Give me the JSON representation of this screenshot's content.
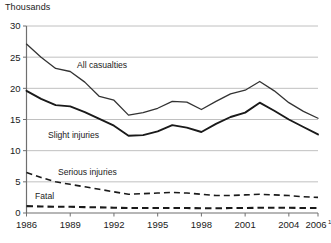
{
  "chart_data": {
    "type": "line",
    "title": "Thousands",
    "xlabel": "",
    "ylabel": "Thousands",
    "ylim": [
      0,
      30
    ],
    "yticks": [
      0,
      5,
      10,
      15,
      20,
      25,
      30
    ],
    "xlim": [
      1986,
      2006
    ],
    "xticks": [
      1986,
      1989,
      1992,
      1995,
      1998,
      2001,
      2004,
      2006
    ],
    "xtick_labels": [
      "1986",
      "1989",
      "1992",
      "1995",
      "1998",
      "2001",
      "2004",
      "2006"
    ],
    "last_xtick_superscript": "1",
    "grid": "horizontal",
    "legend_position": "inline-labels",
    "x": [
      1986,
      1987,
      1988,
      1989,
      1990,
      1991,
      1992,
      1993,
      1994,
      1995,
      1996,
      1997,
      1998,
      1999,
      2000,
      2001,
      2002,
      2003,
      2004,
      2005,
      2006
    ],
    "series": [
      {
        "name": "All casualties",
        "style": "solid-thin",
        "values": [
          27.1,
          25.0,
          23.2,
          22.7,
          21.0,
          18.7,
          18.1,
          15.7,
          16.1,
          16.8,
          17.9,
          17.8,
          16.6,
          17.9,
          19.1,
          19.7,
          21.1,
          19.6,
          17.7,
          16.3,
          15.2
        ]
      },
      {
        "name": "Slight injuries",
        "style": "solid-bold",
        "values": [
          19.6,
          18.3,
          17.3,
          17.1,
          16.2,
          15.1,
          14.0,
          12.4,
          12.5,
          13.1,
          14.1,
          13.7,
          13.0,
          14.3,
          15.4,
          16.1,
          17.7,
          16.4,
          15.0,
          13.8,
          12.6
        ]
      },
      {
        "name": "Serious injuries",
        "style": "dashed",
        "values": [
          6.5,
          5.7,
          5.0,
          4.6,
          4.2,
          3.8,
          3.4,
          3.0,
          3.1,
          3.2,
          3.3,
          3.2,
          3.0,
          2.8,
          2.8,
          2.9,
          3.0,
          2.9,
          2.8,
          2.6,
          2.5
        ]
      },
      {
        "name": "Fatal",
        "style": "dashed-bold",
        "values": [
          1.1,
          1.05,
          1.0,
          1.0,
          0.95,
          0.9,
          0.85,
          0.8,
          0.8,
          0.8,
          0.8,
          0.8,
          0.75,
          0.75,
          0.8,
          0.8,
          0.85,
          0.85,
          0.85,
          0.8,
          0.8
        ]
      }
    ],
    "annotations": [
      {
        "text": "All casualties",
        "x_px": 77,
        "y_px": 68
      },
      {
        "text": "Slight injuries",
        "x_px": 48,
        "y_px": 138
      },
      {
        "text": "Serious injuries",
        "x_px": 58,
        "y_px": 175
      },
      {
        "text": "Fatal",
        "x_px": 35,
        "y_px": 199
      }
    ],
    "colors": {
      "line": "#1a1a1a",
      "gridline": "#b9b9b9",
      "axis": "#6f6f6f",
      "background": "#ffffff",
      "text": "#1a1a1a"
    }
  }
}
